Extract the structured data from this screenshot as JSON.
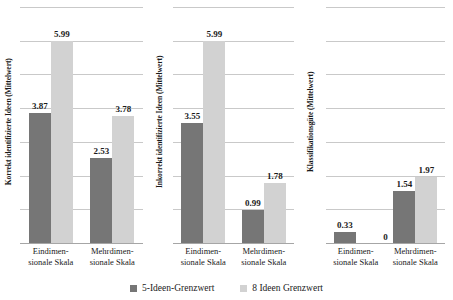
{
  "chart_data": [
    {
      "type": "bar",
      "title": "",
      "ylabel": "Korrekt identifizierte Ideen (Mittelwert)",
      "xlabel": "",
      "categories": [
        "Eindimen-\nsionale Skala",
        "Mehrdimen-\nsionale Skala"
      ],
      "category_lines": [
        [
          "Eindimen-",
          "sionale Skala"
        ],
        [
          "Mehrdimen-",
          "sionale Skala"
        ]
      ],
      "series": [
        {
          "name": "5-Ideen-Grenzwert",
          "color": "#767676",
          "values": [
            3.87,
            2.53
          ]
        },
        {
          "name": "8 Ideen Grenzwert",
          "color": "#d2d2d2",
          "values": [
            5.99,
            3.78
          ]
        }
      ],
      "value_labels": [
        [
          "3.87",
          "5.99"
        ],
        [
          "2.53",
          "3.78"
        ]
      ],
      "ylim": [
        0,
        7.0
      ],
      "grid": true,
      "gridline_values": [
        1,
        2,
        3,
        4,
        5,
        6,
        7
      ]
    },
    {
      "type": "bar",
      "title": "",
      "ylabel": "Inkorrekt identifizierte Ideen (Mittelwert)",
      "xlabel": "",
      "categories": [
        "Eindimen-\nsionale Skala",
        "Mehrdimen-\nsionale Skala"
      ],
      "category_lines": [
        [
          "Eindimen-",
          "sionale Skala"
        ],
        [
          "Mehrdimen-",
          "sionale Skala"
        ]
      ],
      "series": [
        {
          "name": "5-Ideen-Grenzwert",
          "color": "#767676",
          "values": [
            3.55,
            0.99
          ]
        },
        {
          "name": "8 Ideen Grenzwert",
          "color": "#d2d2d2",
          "values": [
            5.99,
            1.78
          ]
        }
      ],
      "value_labels": [
        [
          "3.55",
          "5.99"
        ],
        [
          "0.99",
          "1.78"
        ]
      ],
      "ylim": [
        0,
        7.0
      ],
      "grid": true,
      "gridline_values": [
        1,
        2,
        3,
        4,
        5,
        6,
        7
      ]
    },
    {
      "type": "bar",
      "title": "",
      "ylabel": "Klassifikationsgüte (Mittelwert)",
      "xlabel": "",
      "categories": [
        "Eindimen-\nsionale Skala",
        "Mehrdimen-\nsionale Skala"
      ],
      "category_lines": [
        [
          "Eindimen-",
          "sionale Skala"
        ],
        [
          "Mehrdimen-",
          "sionale Skala"
        ]
      ],
      "series": [
        {
          "name": "5-Ideen-Grenzwert",
          "color": "#767676",
          "values": [
            0.33,
            1.54
          ]
        },
        {
          "name": "8 Ideen Grenzwert",
          "color": "#d2d2d2",
          "values": [
            0,
            1.97
          ]
        }
      ],
      "value_labels": [
        [
          "0.33",
          "0"
        ],
        [
          "1.54",
          "1.97"
        ]
      ],
      "ylim": [
        0,
        7.0
      ],
      "grid": true,
      "gridline_values": [
        1,
        2,
        3,
        4,
        5,
        6,
        7
      ]
    }
  ],
  "panels": [
    {
      "ylabel": "Korrekt identifizierte Ideen (Mittelwert)",
      "groups": [
        {
          "cat_line1": "Eindimen-",
          "cat_line2": "sionale Skala",
          "bars": [
            {
              "value": 3.87,
              "label": "3.87",
              "series": "s1"
            },
            {
              "value": 5.99,
              "label": "5.99",
              "series": "s2"
            }
          ]
        },
        {
          "cat_line1": "Mehrdimen-",
          "cat_line2": "sionale Skala",
          "bars": [
            {
              "value": 2.53,
              "label": "2.53",
              "series": "s1"
            },
            {
              "value": 3.78,
              "label": "3.78",
              "series": "s2"
            }
          ]
        }
      ]
    },
    {
      "ylabel": "Inkorrekt identifizierte Ideen (Mittelwert)",
      "groups": [
        {
          "cat_line1": "Eindimen-",
          "cat_line2": "sionale Skala",
          "bars": [
            {
              "value": 3.55,
              "label": "3.55",
              "series": "s1"
            },
            {
              "value": 5.99,
              "label": "5.99",
              "series": "s2"
            }
          ]
        },
        {
          "cat_line1": "Mehrdimen-",
          "cat_line2": "sionale Skala",
          "bars": [
            {
              "value": 0.99,
              "label": "0.99",
              "series": "s1"
            },
            {
              "value": 1.78,
              "label": "1.78",
              "series": "s2"
            }
          ]
        }
      ]
    },
    {
      "ylabel": "Klassifikationsgüte (Mittelwert)",
      "groups": [
        {
          "cat_line1": "Eindimen-",
          "cat_line2": "sionale Skala",
          "bars": [
            {
              "value": 0.33,
              "label": "0.33",
              "series": "s1"
            },
            {
              "value": 0,
              "label": "0",
              "series": "s2"
            }
          ]
        },
        {
          "cat_line1": "Mehrdimen-",
          "cat_line2": "sionale Skala",
          "bars": [
            {
              "value": 1.54,
              "label": "1.54",
              "series": "s1"
            },
            {
              "value": 1.97,
              "label": "1.97",
              "series": "s2"
            }
          ]
        }
      ]
    }
  ],
  "legend": {
    "items": [
      {
        "label": "5-Ideen-Grenzwert",
        "series": "s1",
        "color": "#767676"
      },
      {
        "label": "8 Ideen Grenzwert",
        "series": "s2",
        "color": "#d2d2d2"
      }
    ]
  },
  "scale": {
    "y_max": 7.0,
    "gridline_count": 7,
    "plot_height_px": 236
  }
}
